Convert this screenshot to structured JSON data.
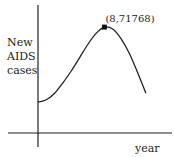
{
  "chart_data": {
    "type": "line",
    "title": "",
    "xlabel": "year",
    "ylabel_lines": [
      "New",
      "AIDS",
      "cases"
    ],
    "ylabel": "New AIDS cases",
    "series": [
      {
        "name": "New AIDS cases",
        "x": [
          0,
          1,
          2,
          3,
          4,
          5,
          6,
          7,
          8,
          9,
          10,
          11,
          12,
          13
        ],
        "y": [
          21000,
          22500,
          27000,
          34000,
          42000,
          51000,
          60000,
          67500,
          71768,
          70500,
          64000,
          54000,
          41000,
          27000
        ]
      }
    ],
    "xlim": [
      0,
      13.5
    ],
    "ylim": [
      0,
      80000
    ],
    "grid": false,
    "ticks_shown": false,
    "annotations": [
      {
        "label": "(8,71768)",
        "x": 8,
        "y": 71768,
        "marker": "square"
      }
    ],
    "line_color": "#222222",
    "axis_color": "#222222"
  }
}
